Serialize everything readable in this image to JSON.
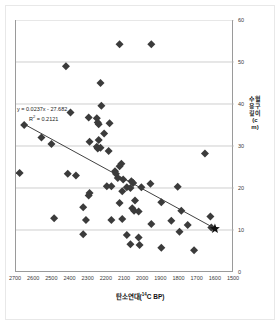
{
  "chart_data": {
    "type": "scatter",
    "title": "",
    "xlabel": "탄소연대(14C BP)",
    "xlabel_main": "탄소연대(",
    "xlabel_sup": "14",
    "xlabel_tail": "C BP)",
    "ylabel": "수혈 용구깊이(cm)",
    "xlim": [
      2700,
      1500
    ],
    "ylim": [
      0,
      60
    ],
    "x_reversed": true,
    "grid": "horizontal",
    "legend": "none",
    "xticks": [
      2700,
      2600,
      2500,
      2400,
      2300,
      2200,
      2100,
      2000,
      1900,
      1800,
      1700,
      1600,
      1500
    ],
    "yticks": [
      0,
      10,
      20,
      30,
      40,
      50,
      60
    ],
    "annotations": {
      "equation_line1": "y = 0.0237x - 27.682",
      "equation_r2_prefix": "R",
      "equation_r2_sup": "2",
      "equation_r2_value": " = 0.2121"
    },
    "trendline": {
      "slope": 0.0237,
      "intercept": -27.682,
      "r_squared": 0.2121,
      "x_start": 2655,
      "y_start": 35.2,
      "x_end": 1615,
      "y_end": 10.6
    },
    "highlight_point": {
      "marker": "star",
      "x": 1605,
      "y": 10.3,
      "color": "#111111"
    },
    "marker": {
      "shape": "diamond",
      "color": "#3b3b3b",
      "size": 4
    },
    "points": [
      [
        2130,
        54.2
      ],
      [
        1955,
        54.2
      ],
      [
        2425,
        49.0
      ],
      [
        2235,
        45.0
      ],
      [
        2230,
        39.6
      ],
      [
        2400,
        38.0
      ],
      [
        2300,
        36.8
      ],
      [
        2255,
        36.6
      ],
      [
        2250,
        35.6
      ],
      [
        2245,
        35.2
      ],
      [
        2185,
        35.4
      ],
      [
        2655,
        35.0
      ],
      [
        2215,
        33.0
      ],
      [
        2560,
        32.0
      ],
      [
        2245,
        31.4
      ],
      [
        2295,
        31.0
      ],
      [
        2505,
        30.5
      ],
      [
        2255,
        29.8
      ],
      [
        2250,
        29.4
      ],
      [
        2235,
        29.6
      ],
      [
        2190,
        28.8
      ],
      [
        1660,
        28.2
      ],
      [
        2120,
        25.8
      ],
      [
        2130,
        25.2
      ],
      [
        2155,
        24.0
      ],
      [
        2150,
        23.4
      ],
      [
        2680,
        23.6
      ],
      [
        2415,
        23.4
      ],
      [
        2370,
        23.0
      ],
      [
        2140,
        22.4
      ],
      [
        2110,
        22.0
      ],
      [
        2065,
        21.6
      ],
      [
        2055,
        21.2
      ],
      [
        1960,
        21.0
      ],
      [
        2200,
        20.4
      ],
      [
        2175,
        20.4
      ],
      [
        2090,
        20.2
      ],
      [
        2070,
        20.0
      ],
      [
        2010,
        20.2
      ],
      [
        1810,
        20.3
      ],
      [
        2115,
        19.2
      ],
      [
        2295,
        18.8
      ],
      [
        2300,
        18.2
      ],
      [
        2045,
        17.0
      ],
      [
        2130,
        16.4
      ],
      [
        1900,
        16.6
      ],
      [
        2330,
        15.4
      ],
      [
        2060,
        15.2
      ],
      [
        2050,
        14.6
      ],
      [
        2025,
        14.4
      ],
      [
        1790,
        14.6
      ],
      [
        1630,
        13.2
      ],
      [
        2490,
        12.8
      ],
      [
        2315,
        12.4
      ],
      [
        2175,
        12.4
      ],
      [
        2115,
        12.6
      ],
      [
        1845,
        12.2
      ],
      [
        1955,
        11.4
      ],
      [
        1755,
        11.2
      ],
      [
        1625,
        10.6
      ],
      [
        1800,
        9.6
      ],
      [
        2330,
        9.0
      ],
      [
        2090,
        8.8
      ],
      [
        2025,
        8.2
      ],
      [
        2070,
        6.6
      ],
      [
        2020,
        6.4
      ],
      [
        1900,
        5.8
      ],
      [
        1720,
        5.2
      ]
    ]
  }
}
